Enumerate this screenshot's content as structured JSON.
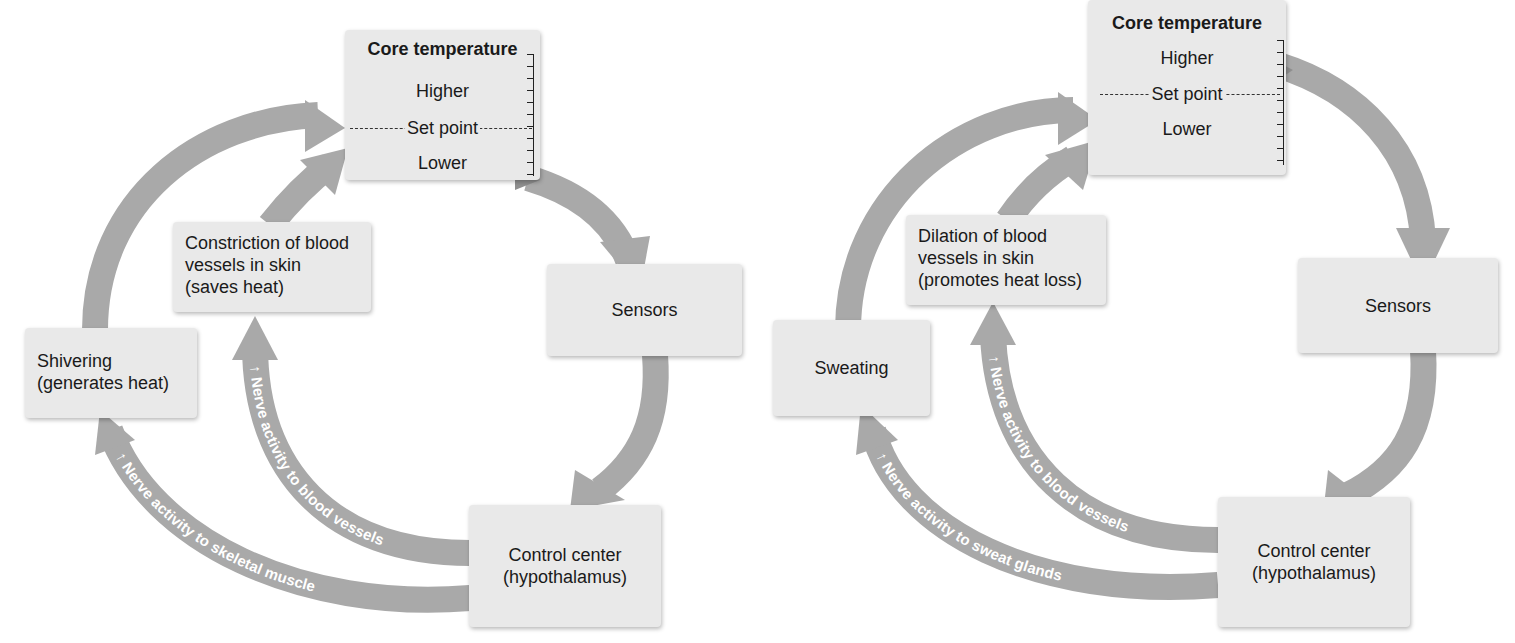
{
  "diagrams": [
    {
      "id": "cold-response",
      "core": {
        "title": "Core temperature",
        "higher": "Higher",
        "set_point": "Set point",
        "lower": "Lower"
      },
      "sensors": "Sensors",
      "control": [
        "Control center",
        "(hypothalamus)"
      ],
      "effector_vessels": [
        "Constriction of blood",
        "vessels in skin",
        "(saves heat)"
      ],
      "effector_other": [
        "Shivering",
        "(generates heat)"
      ],
      "nerve_vessels": "Nerve activity to blood vessels",
      "nerve_other": "Nerve activity to skeletal muscle",
      "increase_glyph": "↑"
    },
    {
      "id": "heat-response",
      "core": {
        "title": "Core temperature",
        "higher": "Higher",
        "set_point": "Set point",
        "lower": "Lower"
      },
      "sensors": "Sensors",
      "control": [
        "Control center",
        "(hypothalamus)"
      ],
      "effector_vessels": [
        "Dilation of blood",
        "vessels in skin",
        "(promotes heat loss)"
      ],
      "effector_other": [
        "Sweating"
      ],
      "nerve_vessels": "Nerve activity to blood vessels",
      "nerve_other": "Nerve activity to sweat glands",
      "increase_glyph": "↑"
    }
  ],
  "colors": {
    "arrow": "#a9a9a9",
    "box": "#e9e9e9",
    "text": "#1a1a1a",
    "arrow_text": "#ffffff"
  }
}
